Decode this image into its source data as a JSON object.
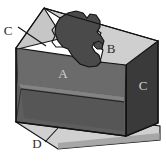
{
  "figure": {
    "type": "3d-box-diagram",
    "background": "#ffffff"
  },
  "labels": {
    "a": "A",
    "b": "B",
    "c_left": "C",
    "c_right": "C",
    "d": "D"
  },
  "label_meta": [
    {
      "text": "A",
      "style": "light-on-dark",
      "x": 63,
      "y": 73,
      "refers_to": "inner-back-wall"
    },
    {
      "text": "B",
      "style": "dark-on-light",
      "x": 111,
      "y": 48,
      "refers_to": "top-rim-light-region"
    },
    {
      "text": "C",
      "style": "dark-on-white",
      "x": 9,
      "y": 35,
      "refers_to": "left-rim-facet",
      "leader": true
    },
    {
      "text": "C",
      "style": "light-on-dark",
      "x": 142,
      "y": 85,
      "refers_to": "right-side-face"
    },
    {
      "text": "D",
      "style": "dark-on-white",
      "x": 36,
      "y": 145,
      "refers_to": "base-ledge",
      "leader": true
    }
  ],
  "colors": {
    "outline": "#111111",
    "rim_light": "#cfcfcf",
    "rim_mid": "#b4b4b4",
    "blob_dark": "#4a4a4a",
    "wall_back": "#6b6b6b",
    "wall_front_left": "#5a5a5a",
    "wall_right": "#3a3a3a",
    "floor": "#555555",
    "base_ledge": "#d0d0d0",
    "base_shadow": "#9a9a9a",
    "label_light": "#d2d2d2",
    "label_dark": "#2b2b2b"
  },
  "parts": [
    {
      "key": "A",
      "name": "inner-back-wall"
    },
    {
      "key": "B",
      "name": "top-rim-light-region"
    },
    {
      "key": "C",
      "name": "rim-and-side-faces"
    },
    {
      "key": "D",
      "name": "base-ledge"
    }
  ]
}
